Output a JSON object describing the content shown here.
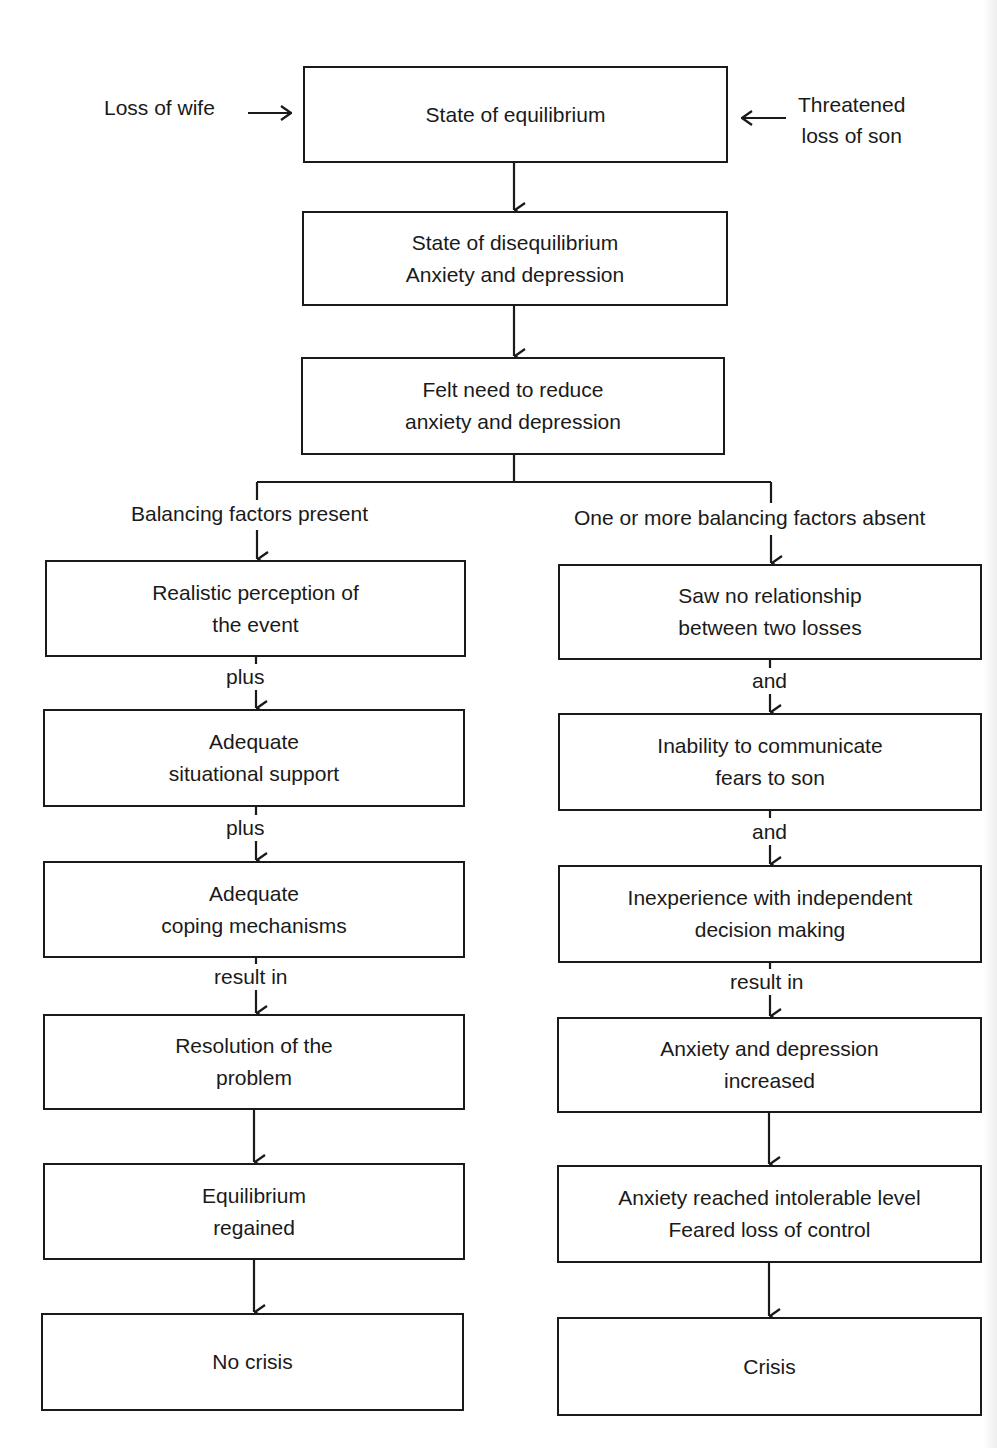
{
  "diagram": {
    "inputs": {
      "left": "Loss of wife",
      "right_line1": "Threatened",
      "right_line2": "loss of son"
    },
    "top_chain": [
      {
        "line1": "State of equilibrium",
        "line2": ""
      },
      {
        "line1": "State of disequilibrium",
        "line2": "Anxiety and depression"
      },
      {
        "line1": "Felt need to reduce",
        "line2": "anxiety and depression"
      }
    ],
    "branches": {
      "left": {
        "heading": "Balancing factors present",
        "boxes": [
          {
            "line1": "Realistic perception of",
            "line2": "the event"
          },
          {
            "line1": "Adequate",
            "line2": "situational support"
          },
          {
            "line1": "Adequate",
            "line2": "coping mechanisms"
          },
          {
            "line1": "Resolution of the",
            "line2": "problem"
          },
          {
            "line1": "Equilibrium",
            "line2": "regained"
          },
          {
            "line1": "No crisis",
            "line2": ""
          }
        ],
        "connectors": [
          "plus",
          "plus",
          "result in",
          "",
          ""
        ]
      },
      "right": {
        "heading": "One or more balancing factors absent",
        "boxes": [
          {
            "line1": "Saw no relationship",
            "line2": "between two losses"
          },
          {
            "line1": "Inability to communicate",
            "line2": "fears to son"
          },
          {
            "line1": "Inexperience with independent",
            "line2": "decision making"
          },
          {
            "line1": "Anxiety and depression",
            "line2": "increased"
          },
          {
            "line1": "Anxiety reached intolerable level",
            "line2": "Feared loss of control"
          },
          {
            "line1": "Crisis",
            "line2": ""
          }
        ],
        "connectors": [
          "and",
          "and",
          "result in",
          "",
          ""
        ]
      }
    }
  }
}
